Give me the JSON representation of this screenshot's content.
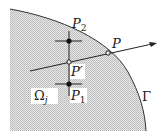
{
  "diagram": {
    "colors": {
      "region_fill": "#d4d4d4",
      "stroke": "#333333",
      "background": "#ffffff"
    },
    "labels": {
      "P2": {
        "base": "P",
        "sub": "2"
      },
      "P": {
        "text": "P"
      },
      "P_prime": {
        "text": "P′"
      },
      "P1": {
        "base": "P",
        "sub": "1"
      },
      "Omega": {
        "base": "Ω",
        "sub": "j"
      },
      "Gamma": {
        "text": "Γ"
      }
    },
    "points": {
      "P2_dot": {
        "type": "filled",
        "x": 69,
        "y": 41
      },
      "P1_dot": {
        "type": "filled",
        "x": 69,
        "y": 84
      },
      "P_prime": {
        "type": "open",
        "x": 69,
        "y": 62
      },
      "P": {
        "type": "open",
        "x": 108,
        "y": 53
      }
    },
    "icons": {
      "arrow": "arrowhead-right"
    }
  }
}
